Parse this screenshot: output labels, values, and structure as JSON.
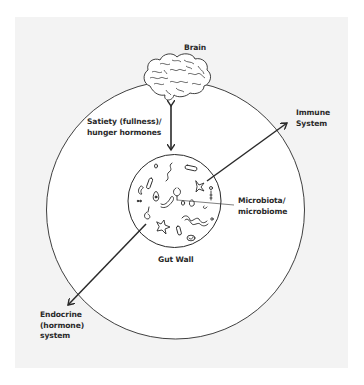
{
  "diagram": {
    "type": "gut-brain axis schematic",
    "colors": {
      "background": "#ffffff",
      "panel": "#f3f3f3",
      "inner_fill": "#ffffff",
      "stroke": "#2a2a2a",
      "text": "#2a2a2a"
    },
    "nodes": {
      "brain": {
        "label": "Brain",
        "icon": "brain-icon"
      },
      "gut_wall": {
        "label": "Gut Wall"
      },
      "microbiota": {
        "label": "Microbiota/\nmicrobiome"
      },
      "immune": {
        "label": "Immune\nSystem"
      },
      "endocrine": {
        "label": "Endocrine\n(hormone)\nsystem"
      }
    },
    "edges": [
      {
        "from": "gut_wall",
        "to": "brain",
        "label": "Satiety (fullness)/\nhunger hormones",
        "direction": "bidirectional"
      },
      {
        "from": "gut_wall",
        "to": "immune",
        "label": "",
        "direction": "to"
      },
      {
        "from": "gut_wall",
        "to": "endocrine",
        "label": "",
        "direction": "to"
      },
      {
        "from": "microbiota",
        "to": "gut_wall",
        "label": "",
        "direction": "leader-line"
      }
    ]
  }
}
